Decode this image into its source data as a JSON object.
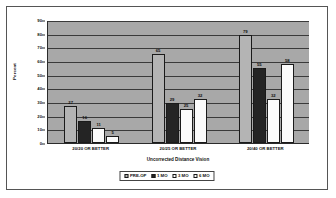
{
  "chart_data": {
    "type": "bar",
    "title": "",
    "xlabel": "Uncorrected Distance Vision",
    "ylabel": "Percent",
    "ylim": [
      0,
      90
    ],
    "yticks": [
      0,
      10,
      20,
      30,
      40,
      50,
      60,
      70,
      80,
      90
    ],
    "grid": true,
    "legend_position": "bottom",
    "categories": [
      "20/20 OR BETTER",
      "20/25 OR BETTER",
      "20/40 OR BETTER"
    ],
    "series": [
      {
        "name": "PRE-OP",
        "color": "#b4b4b4",
        "values": [
          27,
          65,
          79
        ]
      },
      {
        "name": "1 MO",
        "color": "#242424",
        "values": [
          16,
          29,
          55
        ]
      },
      {
        "name": "3 MO",
        "color": "#fbfbfb",
        "values": [
          11,
          25,
          32
        ]
      },
      {
        "name": "6 MO",
        "color": "#fbfbfb",
        "values": [
          5,
          32,
          58
        ]
      }
    ]
  },
  "plot": {
    "background_color": "#a8a8a8",
    "gridline_color": "#3a3a3a",
    "axis_color": "#2b2b2b"
  },
  "frame": {
    "background_color": "#ffffff",
    "border_color": "#555555"
  }
}
